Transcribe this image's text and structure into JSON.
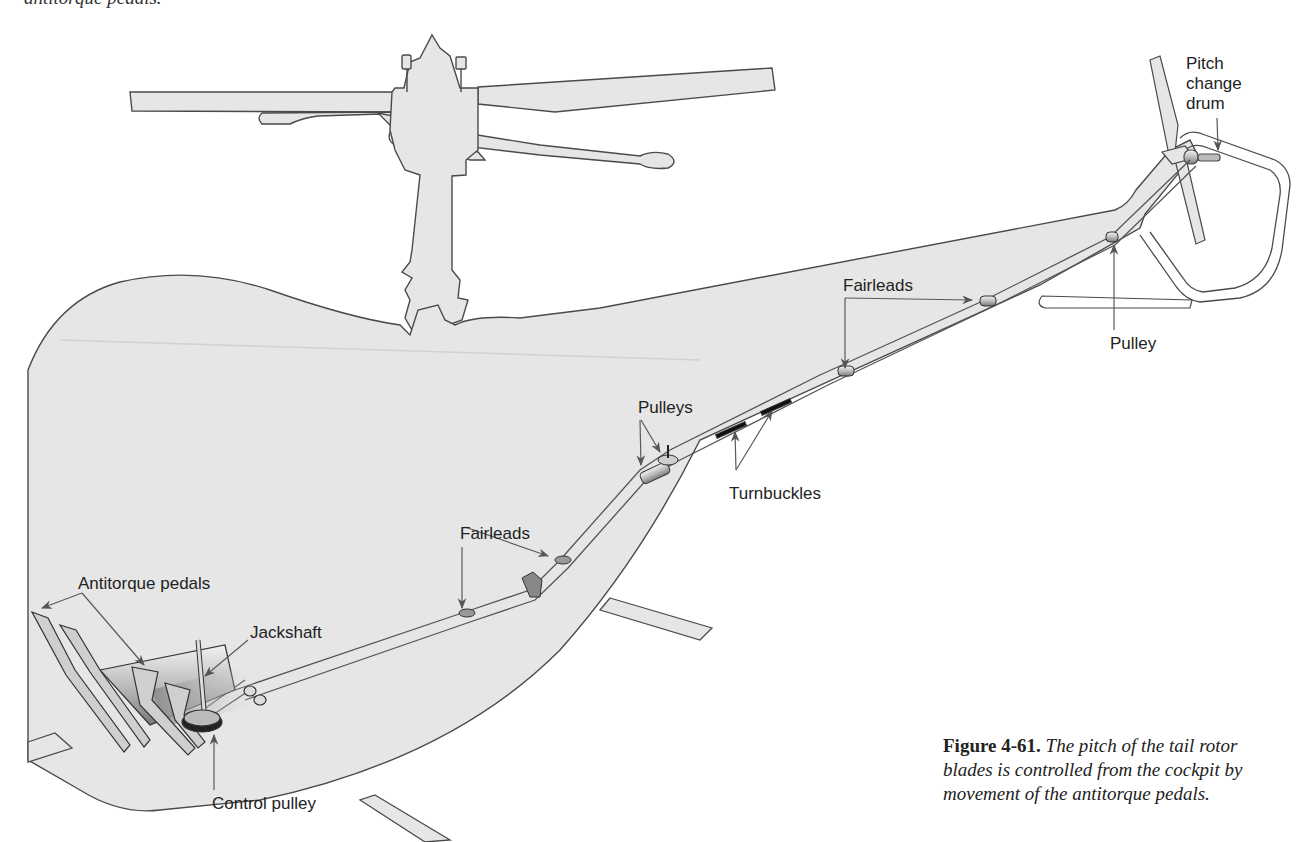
{
  "page": {
    "cut_text_top": "antitorque pedals."
  },
  "figure": {
    "number": "Figure 4-61.",
    "caption_text": "The pitch of the tail rotor blades is controlled from the cockpit by movement of the antitorque pedals.",
    "caption_lines": [
      "The pitch of the tail rotor",
      "blades is controlled from the cockpit by",
      "movement of the antitorque pedals."
    ]
  },
  "labels": {
    "pitch_change_drum": [
      "Pitch",
      "change",
      "drum"
    ],
    "pulley_tail": "Pulley",
    "fairleads_tailboom": "Fairleads",
    "pulleys_mid": "Pulleys",
    "turnbuckles": "Turnbuckles",
    "fairleads_cabin": "Fairleads",
    "antitorque_pedals": "Antitorque pedals",
    "jackshaft": "Jackshaft",
    "control_pulley": "Control pulley"
  },
  "colors": {
    "body_fill": "#e6e6e6",
    "outline": "#4a4a4a",
    "cable": "#555555",
    "leader": "#5a5a5a",
    "background": "#ffffff"
  }
}
